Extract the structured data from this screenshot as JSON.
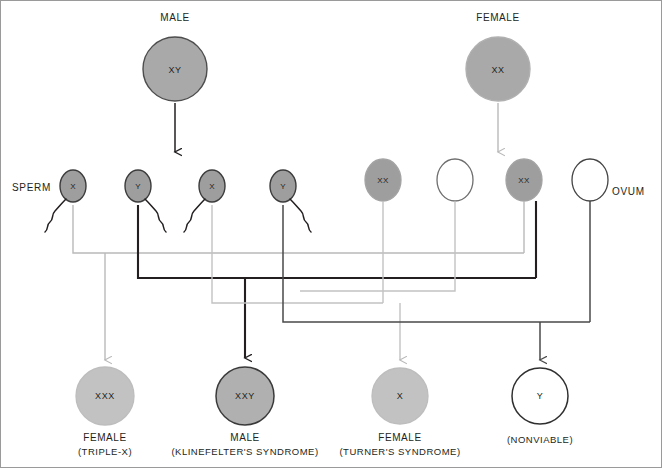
{
  "diagram": {
    "colors": {
      "parent_fill": "#a9a9a9",
      "parent_stroke": "#4d4d4d",
      "gamete_gray_fill": "#9e9e9e",
      "gamete_gray_stroke": "#3c3c3c",
      "gamete_white_fill": "#ffffff",
      "gamete_white_stroke": "#6e6e6e",
      "offspring_light_fill": "#c2c2c2",
      "offspring_mid_fill": "#b0b0b0",
      "offspring_white_fill": "#ffffff",
      "line_dark": "#231f20",
      "line_light": "#b9b9b9",
      "line_mid": "#6f6f6f",
      "text": "#231f20",
      "border": "#9a9a9a"
    }
  },
  "parents": [
    {
      "label": "MALE",
      "genotype": "XY",
      "shade": "gray"
    },
    {
      "label": "FEMALE",
      "genotype": "XX",
      "shade": "gray"
    }
  ],
  "row_labels": {
    "sperm": "SPERM",
    "ovum": "OVUM"
  },
  "sperm": [
    {
      "genotype": "X",
      "shade": "gray"
    },
    {
      "genotype": "Y",
      "shade": "gray"
    },
    {
      "genotype": "X",
      "shade": "gray"
    },
    {
      "genotype": "Y",
      "shade": "gray"
    }
  ],
  "ova": [
    {
      "genotype": "XX",
      "shade": "gray"
    },
    {
      "genotype": "",
      "shade": "white"
    },
    {
      "genotype": "XX",
      "shade": "gray"
    },
    {
      "genotype": "",
      "shade": "white"
    }
  ],
  "offspring": [
    {
      "genotype": "XXX",
      "sex": "FEMALE",
      "caption": "(TRIPLE-X)",
      "shade": "light"
    },
    {
      "genotype": "XXY",
      "sex": "MALE",
      "caption": "(KLINEFELTER'S SYNDROME)",
      "shade": "mid"
    },
    {
      "genotype": "X",
      "sex": "FEMALE",
      "caption": "(TURNER'S SYNDROME)",
      "shade": "light"
    },
    {
      "genotype": "Y",
      "sex": "",
      "caption": "(NONVIABLE)",
      "shade": "white"
    }
  ]
}
